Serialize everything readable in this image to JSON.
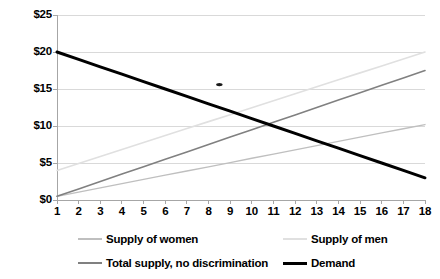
{
  "chart_data": {
    "type": "line",
    "title": "",
    "subtitle": "",
    "xlabel": "",
    "ylabel": "",
    "x": [
      1,
      2,
      3,
      4,
      5,
      6,
      7,
      8,
      9,
      10,
      11,
      12,
      13,
      14,
      15,
      16,
      17,
      18
    ],
    "xlim": [
      1,
      18
    ],
    "ylim": [
      0,
      25
    ],
    "grid": true,
    "legend_position": "bottom",
    "y_tick_labels": [
      "$0",
      "$5",
      "$10",
      "$15",
      "$20",
      "$25"
    ],
    "y_tick_values": [
      0,
      5,
      10,
      15,
      20,
      25
    ],
    "x_tick_labels": [
      "1",
      "2",
      "3",
      "4",
      "5",
      "6",
      "7",
      "8",
      "9",
      "10",
      "11",
      "12",
      "13",
      "14",
      "15",
      "16",
      "17",
      "18"
    ],
    "series": [
      {
        "name": "Supply of women",
        "color": "#bfbfbf",
        "width": 1.3,
        "values": [
          0.5,
          1.07,
          1.64,
          2.21,
          2.78,
          3.35,
          3.92,
          4.49,
          5.06,
          5.64,
          6.21,
          6.78,
          7.35,
          7.92,
          8.49,
          9.06,
          9.63,
          10.2
        ]
      },
      {
        "name": "Supply of men",
        "color": "#e0e0e0",
        "width": 1.6,
        "values": [
          4.0,
          4.94,
          5.88,
          6.82,
          7.76,
          8.71,
          9.65,
          10.59,
          11.53,
          12.47,
          13.41,
          14.35,
          15.29,
          16.24,
          17.18,
          18.12,
          19.06,
          20.0
        ]
      },
      {
        "name": "Total supply, no discrimination",
        "color": "#808080",
        "width": 1.6,
        "values": [
          0.5,
          1.5,
          2.5,
          3.5,
          4.5,
          5.5,
          6.5,
          7.5,
          8.5,
          9.5,
          10.5,
          11.5,
          12.5,
          13.5,
          14.5,
          15.5,
          16.5,
          17.5
        ]
      },
      {
        "name": "Demand",
        "color": "#000000",
        "width": 3.0,
        "values": [
          20.0,
          19.0,
          18.0,
          17.0,
          16.0,
          15.0,
          14.0,
          13.0,
          12.0,
          11.0,
          10.0,
          9.0,
          8.0,
          7.0,
          6.0,
          5.0,
          4.0,
          3.0
        ]
      }
    ],
    "annotations": [
      {
        "name": "marker-dot",
        "x": 8.5,
        "y": 15.6,
        "color": "#1a1a1a"
      }
    ],
    "colors": {
      "grid": "#d9d9d9",
      "axis": "#a6a6a6",
      "background": "#ffffff",
      "text": "#000000"
    }
  },
  "legend": {
    "rows": [
      [
        {
          "label": "Supply of women",
          "color": "#bfbfbf",
          "width": 1.3
        },
        {
          "label": "Supply of men",
          "color": "#e0e0e0",
          "width": 1.6
        }
      ],
      [
        {
          "label": "Total supply, no discrimination",
          "color": "#808080",
          "width": 1.6
        },
        {
          "label": "Demand",
          "color": "#000000",
          "width": 3.0
        }
      ]
    ]
  }
}
